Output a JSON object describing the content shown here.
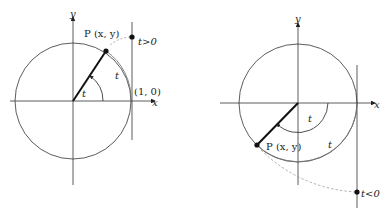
{
  "diagrams": [
    {
      "id": "positive",
      "axis_x_label": "x",
      "axis_y_label": "y",
      "point_label": "P (x, y)",
      "angle_label": "t",
      "arc_label": "t",
      "tangent_point_label": "t>0",
      "unit_point_label": "(1, 0)"
    },
    {
      "id": "negative",
      "axis_x_label": "x",
      "axis_y_label": "y",
      "point_label": "P (x, y)",
      "angle_label": "t",
      "arc_label": "t",
      "tangent_point_label": "t<0"
    }
  ],
  "colors": {
    "ink": "#222222",
    "light": "#777777",
    "dash": "#999999"
  }
}
